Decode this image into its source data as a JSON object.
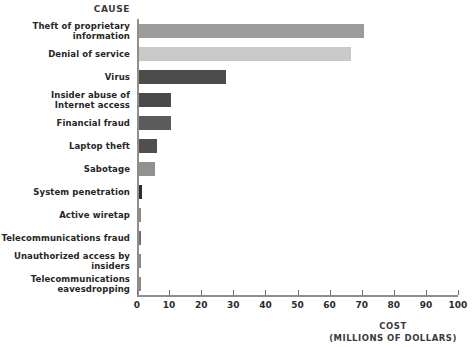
{
  "chart_data": {
    "type": "bar",
    "orientation": "horizontal",
    "title": "",
    "category_axis_label": "CAUSE",
    "value_axis_label": "COST",
    "value_axis_sublabel": "(MILLIONS OF DOLLARS)",
    "xlabel": "COST (MILLIONS OF DOLLARS)",
    "ylabel": "CAUSE",
    "xlim": [
      0,
      100
    ],
    "grid": false,
    "legend": "none",
    "tick_labels": [
      "0",
      "10",
      "20",
      "30",
      "40",
      "50",
      "60",
      "70",
      "80",
      "90",
      "100"
    ],
    "ticks": [
      0,
      10,
      20,
      30,
      40,
      50,
      60,
      70,
      80,
      90,
      100
    ],
    "categories": [
      "Theft of proprietary information",
      "Denial of service",
      "Virus",
      "Insider abuse of Internet access",
      "Financial fraud",
      "Laptop theft",
      "Sabotage",
      "System penetration",
      "Active wiretap",
      "Telecommunications fraud",
      "Unauthorized access by insiders",
      "Telecommunications eavesdropping"
    ],
    "values": [
      70,
      66,
      27,
      10,
      10,
      5.6,
      5,
      1,
      0.5,
      0.5,
      0.4,
      0.4
    ],
    "bars": [
      {
        "label_line1": "Theft of proprietary",
        "label_line2": "information",
        "value": 70,
        "color": "#9c9c9c"
      },
      {
        "label_line1": "Denial of service",
        "label_line2": "",
        "value": 66,
        "color": "#c9c9c9"
      },
      {
        "label_line1": "Virus",
        "label_line2": "",
        "value": 27,
        "color": "#4c4c4c"
      },
      {
        "label_line1": "Insider abuse of",
        "label_line2": "Internet access",
        "value": 10,
        "color": "#4a4a4a"
      },
      {
        "label_line1": "Financial fraud",
        "label_line2": "",
        "value": 10,
        "color": "#5c5c5c"
      },
      {
        "label_line1": "Laptop theft",
        "label_line2": "",
        "value": 5.6,
        "color": "#4f4f4f"
      },
      {
        "label_line1": "Sabotage",
        "label_line2": "",
        "value": 5,
        "color": "#919191"
      },
      {
        "label_line1": "System penetration",
        "label_line2": "",
        "value": 1,
        "color": "#2e2e2e"
      },
      {
        "label_line1": "Active wiretap",
        "label_line2": "",
        "value": 0.5,
        "color": "#8a8a8a"
      },
      {
        "label_line1": "Telecommunications fraud",
        "label_line2": "",
        "value": 0.5,
        "color": "#6f6f6f"
      },
      {
        "label_line1": "Unauthorized access by",
        "label_line2": "insiders",
        "value": 0.4,
        "color": "#8a8a8a"
      },
      {
        "label_line1": "Telecommunications",
        "label_line2": "eavesdropping",
        "value": 0.4,
        "color": "#8a8a8a"
      }
    ],
    "colors": {
      "axis": "#8e8e8e",
      "text": "#262626",
      "background": "#ffffff"
    }
  }
}
